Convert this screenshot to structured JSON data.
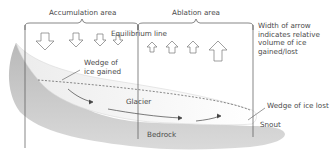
{
  "diagram": {
    "title_regions": {
      "accumulation": "Accumulation area",
      "ablation": "Ablation area"
    },
    "equilibrium_line_label": "Equilibrium line",
    "legend_note": "Width of arrow\nindicates relative\nvolume of ice\ngained/lost",
    "wedge_gained_label": "Wedge of\nice gained",
    "wedge_lost_label": "Wedge of ice lost",
    "glacier_label": "Glacier",
    "bedrock_label": "Bedrock",
    "snout_label": "Snout",
    "arrows": {
      "accumulation_down": [
        {
          "x": 45,
          "size": "large"
        },
        {
          "x": 76,
          "size": "medium"
        },
        {
          "x": 100,
          "size": "medium"
        },
        {
          "x": 118,
          "size": "small"
        }
      ],
      "ablation_up": [
        {
          "x": 152,
          "size": "small"
        },
        {
          "x": 172,
          "size": "medium"
        },
        {
          "x": 193,
          "size": "medium"
        },
        {
          "x": 218,
          "size": "large"
        }
      ]
    },
    "colors": {
      "bedrock": "#c9c9c9",
      "glacier": "#f7f7f7",
      "line": "#555555",
      "text": "#4a4a4a"
    }
  }
}
